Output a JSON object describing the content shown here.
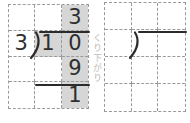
{
  "palette": {
    "background": "#ffffff",
    "grid_line": "#9a9a9a",
    "shaded_cell": "#d6d6d6",
    "ink": "#2b2b2b",
    "digit_color": "#2e2e2e",
    "watermark_color": "#b7b2aa"
  },
  "watermark": {
    "text": "くり下がり"
  },
  "worked_problem": {
    "quotient": "3",
    "divisor": "3",
    "dividend_tens": "1",
    "dividend_ones": "0",
    "product": "9",
    "remainder": "1"
  }
}
